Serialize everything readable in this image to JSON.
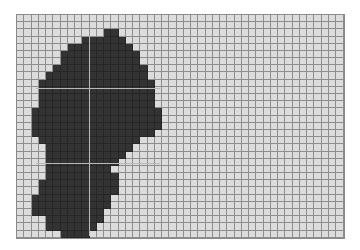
{
  "board": {
    "columns": 45,
    "rows": 31,
    "colors": {
      "empty": "#dcdcdc",
      "filled": "#333333",
      "gridline": "#8e8e8e",
      "guide": "#b8b8b8"
    },
    "filled_spans": [
      {
        "row": 2,
        "from": 12,
        "to": 13
      },
      {
        "row": 3,
        "from": 9,
        "to": 14
      },
      {
        "row": 4,
        "from": 7,
        "to": 15
      },
      {
        "row": 5,
        "from": 6,
        "to": 16
      },
      {
        "row": 6,
        "from": 6,
        "to": 16
      },
      {
        "row": 7,
        "from": 5,
        "to": 17
      },
      {
        "row": 8,
        "from": 4,
        "to": 17
      },
      {
        "row": 9,
        "from": 3,
        "to": 18
      },
      {
        "row": 10,
        "from": 3,
        "to": 18
      },
      {
        "row": 11,
        "from": 3,
        "to": 18
      },
      {
        "row": 12,
        "from": 3,
        "to": 18
      },
      {
        "row": 13,
        "from": 2,
        "to": 19
      },
      {
        "row": 14,
        "from": 2,
        "to": 19
      },
      {
        "row": 15,
        "from": 2,
        "to": 19
      },
      {
        "row": 16,
        "from": 2,
        "to": 18
      },
      {
        "row": 17,
        "from": 3,
        "to": 16
      },
      {
        "row": 18,
        "from": 4,
        "to": 15
      },
      {
        "row": 19,
        "from": 4,
        "to": 14
      },
      {
        "row": 20,
        "from": 4,
        "to": 13
      },
      {
        "row": 21,
        "from": 4,
        "to": 12
      },
      {
        "row": 22,
        "from": 4,
        "to": 13
      },
      {
        "row": 23,
        "from": 3,
        "to": 13
      },
      {
        "row": 24,
        "from": 3,
        "to": 13
      },
      {
        "row": 25,
        "from": 2,
        "to": 12
      },
      {
        "row": 26,
        "from": 2,
        "to": 12
      },
      {
        "row": 27,
        "from": 2,
        "to": 11
      },
      {
        "row": 28,
        "from": 4,
        "to": 11
      },
      {
        "row": 29,
        "from": 4,
        "to": 10
      },
      {
        "row": 30,
        "from": 6,
        "to": 9
      }
    ],
    "guides": {
      "vertical_x": [
        89
      ],
      "horizontal_y": [
        88,
        163
      ],
      "vertical_range": [
        36,
        236
      ],
      "horizontal_range": [
        36,
        160
      ]
    }
  }
}
